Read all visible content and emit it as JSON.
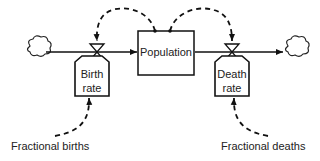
{
  "diagram": {
    "type": "stock-and-flow",
    "stock": {
      "label": "Population"
    },
    "flows": [
      {
        "id": "birth",
        "label_line1": "Birth",
        "label_line2": "rate"
      },
      {
        "id": "death",
        "label_line1": "Death",
        "label_line2": "rate"
      }
    ],
    "auxiliaries": [
      {
        "id": "fractional-births",
        "label": "Fractional births"
      },
      {
        "id": "fractional-deaths",
        "label": "Fractional deaths"
      }
    ],
    "sources_sinks": [
      "source-cloud",
      "sink-cloud"
    ],
    "colors": {
      "line": "#111111",
      "background": "#ffffff"
    }
  }
}
